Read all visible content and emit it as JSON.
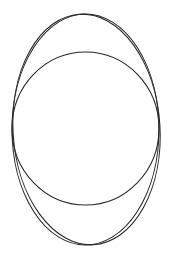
{
  "figure": {
    "width": 172,
    "height": 259,
    "background": "#ffffff",
    "stroke_color": "#2a2a2a",
    "stroke_width": 1.1,
    "shapes": [
      {
        "name": "outer-ellipse",
        "type": "ellipse",
        "cx": 85.5,
        "cy": 129.5,
        "rx": 73.5,
        "ry": 115.5,
        "rotation": 0
      },
      {
        "name": "outer-ellipse-tilted",
        "type": "ellipse",
        "cx": 86.5,
        "cy": 129.5,
        "rx": 73.5,
        "ry": 115.5,
        "rotation": -3.5
      },
      {
        "name": "inner-circle",
        "type": "ellipse",
        "cx": 85.5,
        "cy": 128.5,
        "rx": 73.5,
        "ry": 76.5,
        "rotation": 0
      }
    ]
  }
}
